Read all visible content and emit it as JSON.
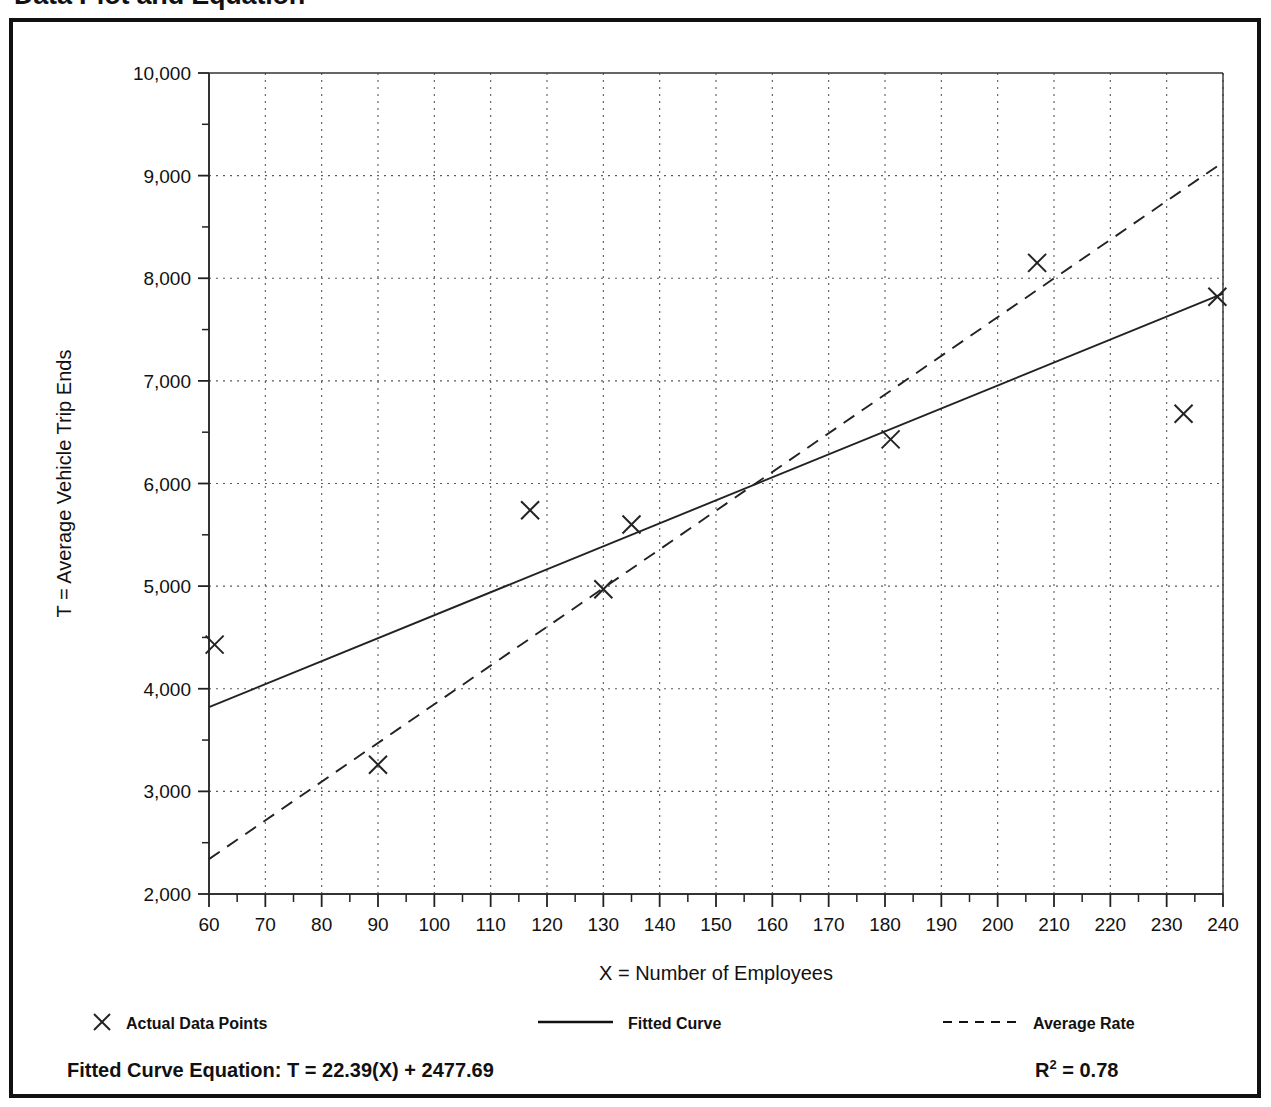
{
  "page": {
    "title": "Data Plot and Equation"
  },
  "chart_data": {
    "type": "scatter",
    "title": "Data Plot and Equation",
    "xlabel": "X = Number of Employees",
    "ylabel": "T = Average Vehicle Trip Ends",
    "xlim": [
      60,
      240
    ],
    "ylim": [
      2000,
      10000
    ],
    "x_major_step": 10,
    "x_minor_step": 5,
    "y_major_step": 1000,
    "y_minor_step": 500,
    "grid": true,
    "grid_style": "dotted",
    "xticks": [
      60,
      70,
      80,
      90,
      100,
      110,
      120,
      130,
      140,
      150,
      160,
      170,
      180,
      190,
      200,
      210,
      220,
      230,
      240
    ],
    "xtick_labels": [
      "60",
      "70",
      "80",
      "90",
      "100",
      "110",
      "120",
      "130",
      "140",
      "150",
      "160",
      "170",
      "180",
      "190",
      "200",
      "210",
      "220",
      "230",
      "240"
    ],
    "yticks": [
      2000,
      3000,
      4000,
      5000,
      6000,
      7000,
      8000,
      9000,
      10000
    ],
    "ytick_labels": [
      "2,000",
      "3,000",
      "4,000",
      "5,000",
      "6,000",
      "7,000",
      "8,000",
      "9,000",
      "10,000"
    ],
    "series": [
      {
        "name": "Actual Data Points",
        "type": "scatter",
        "marker": "x",
        "points": [
          {
            "x": 61,
            "y": 4430
          },
          {
            "x": 90,
            "y": 3260
          },
          {
            "x": 117,
            "y": 5740
          },
          {
            "x": 130,
            "y": 4970
          },
          {
            "x": 135,
            "y": 5600
          },
          {
            "x": 181,
            "y": 6430
          },
          {
            "x": 207,
            "y": 8150
          },
          {
            "x": 233,
            "y": 6680
          },
          {
            "x": 239,
            "y": 7820
          }
        ]
      },
      {
        "name": "Fitted Curve",
        "type": "line",
        "style": "solid",
        "endpoints": [
          {
            "x": 60,
            "y": 3821
          },
          {
            "x": 240,
            "y": 7851
          }
        ],
        "slope": 22.39,
        "intercept": 2477.69
      },
      {
        "name": "Average Rate",
        "type": "line",
        "style": "dashed",
        "endpoints": [
          {
            "x": 60,
            "y": 2340
          },
          {
            "x": 240,
            "y": 9130
          }
        ]
      }
    ],
    "legend": {
      "position": "below-axis",
      "entries": [
        {
          "label": "Actual Data Points",
          "marker": "x"
        },
        {
          "label": "Fitted Curve",
          "marker": "solid-line"
        },
        {
          "label": "Average Rate",
          "marker": "dashed-line"
        }
      ]
    },
    "annotations": {
      "equation_label": "Fitted Curve Equation:",
      "equation_value": "T = 22.39(X) + 2477.69",
      "r_squared_base": "R",
      "r_squared_exp": "2",
      "r_squared_value": "= 0.78"
    }
  }
}
